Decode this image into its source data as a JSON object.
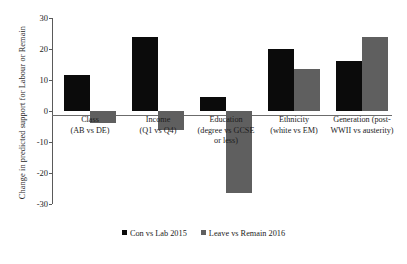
{
  "chart_data": {
    "type": "bar",
    "title": "",
    "xlabel": "",
    "ylabel": "Change in predicted support for Labour or Remain",
    "ylim": [
      -30,
      30
    ],
    "yticks": [
      30,
      20,
      10,
      0,
      -10,
      -20,
      -30
    ],
    "ytick_labels": [
      "30",
      "20",
      "10",
      "0",
      "-10",
      "-20",
      "-30"
    ],
    "grid": false,
    "legend_position": "bottom",
    "categories": [
      "Class\n(AB vs DE)",
      "Income\n(Q1 vs Q4)",
      "Education\n(degree vs GCSE\nor less)",
      "Ethnicity\n(white vs EM)",
      "Generation (post-\nWWII vs austerity)"
    ],
    "series": [
      {
        "name": "Con vs Lab 2015",
        "color": "#0b0b0b",
        "values": [
          11.5,
          24,
          4.5,
          20,
          16
        ]
      },
      {
        "name": "Leave vs Remain 2016",
        "color": "#5f5f5f",
        "values": [
          -4,
          -6,
          -26.5,
          13.5,
          24
        ]
      }
    ]
  },
  "legend": {
    "items": [
      {
        "label": "Con vs Lab 2015",
        "color": "#0b0b0b"
      },
      {
        "label": "Leave vs Remain 2016",
        "color": "#5f5f5f"
      }
    ]
  }
}
